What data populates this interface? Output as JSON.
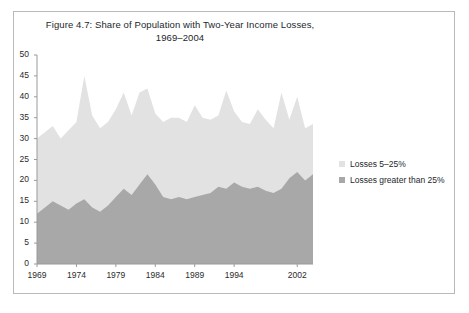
{
  "figure": {
    "title_line1": "Figure 4.7: Share of Population with Two-Year Income Losses,",
    "title_line2": "1969–2004"
  },
  "legend": {
    "position": "right",
    "items": [
      {
        "label": "Losses 5–25%",
        "color": "#e2e2e2",
        "marker": "legend-swatch-light"
      },
      {
        "label": "Losses greater than 25%",
        "color": "#a8a8a8",
        "marker": "legend-swatch-dark"
      }
    ]
  },
  "axes": {
    "y_ticks": [
      "0",
      "5",
      "10",
      "15",
      "20",
      "25",
      "30",
      "35",
      "40",
      "45",
      "50"
    ],
    "x_ticks": [
      "1969",
      "1974",
      "1979",
      "1984",
      "1989",
      "1994",
      "2002"
    ]
  },
  "colors": {
    "background": "#ffffff",
    "frame_border": "#b9b9b9",
    "axis_line": "#9a9a9a",
    "text": "#23272b",
    "series_light": "#e2e2e2",
    "series_dark": "#a8a8a8"
  },
  "chart_data": {
    "type": "area",
    "stacked": true,
    "title": "Figure 4.7: Share of Population with Two-Year Income Losses, 1969–2004",
    "xlabel": "",
    "ylabel": "",
    "ylim": [
      0,
      50
    ],
    "xlim": [
      1969,
      2004
    ],
    "grid": false,
    "legend_position": "right",
    "x": [
      1969,
      1970,
      1971,
      1972,
      1973,
      1974,
      1975,
      1976,
      1977,
      1978,
      1979,
      1980,
      1981,
      1982,
      1983,
      1984,
      1985,
      1986,
      1987,
      1988,
      1989,
      1990,
      1991,
      1992,
      1993,
      1994,
      1995,
      1996,
      1997,
      1998,
      1999,
      2000,
      2001,
      2002,
      2003,
      2004
    ],
    "series": [
      {
        "name": "Losses greater than 25%",
        "color": "#a8a8a8",
        "values": [
          12.0,
          13.5,
          15.0,
          14.0,
          13.0,
          14.5,
          15.5,
          13.5,
          12.5,
          14.0,
          16.0,
          18.0,
          16.5,
          19.0,
          21.5,
          19.0,
          16.0,
          15.5,
          16.0,
          15.5,
          16.0,
          16.5,
          17.0,
          18.5,
          18.0,
          19.5,
          18.5,
          18.0,
          18.5,
          17.5,
          17.0,
          18.0,
          20.5,
          22.0,
          20.0,
          21.5
        ]
      },
      {
        "name": "Losses 5–25%",
        "color": "#e2e2e2",
        "values": [
          18.0,
          18.0,
          18.0,
          16.0,
          19.0,
          19.5,
          29.5,
          22.0,
          20.0,
          20.0,
          21.0,
          23.0,
          19.0,
          22.0,
          20.5,
          17.0,
          18.0,
          19.5,
          19.0,
          18.5,
          22.0,
          18.5,
          17.5,
          17.0,
          23.5,
          17.0,
          15.5,
          15.5,
          18.5,
          17.0,
          15.5,
          23.0,
          14.0,
          18.0,
          12.5,
          12.0
        ]
      }
    ],
    "totals": [
      30.0,
      31.5,
      33.0,
      30.0,
      32.0,
      34.0,
      45.0,
      35.5,
      32.5,
      34.0,
      37.0,
      41.0,
      35.5,
      41.0,
      42.0,
      36.0,
      34.0,
      35.0,
      35.0,
      34.0,
      38.0,
      35.0,
      34.5,
      35.5,
      41.5,
      36.5,
      34.0,
      33.5,
      37.0,
      34.5,
      32.5,
      41.0,
      34.5,
      40.0,
      32.5,
      33.5
    ]
  }
}
